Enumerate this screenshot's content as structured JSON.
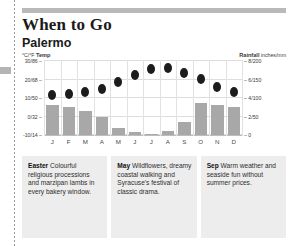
{
  "panel": {
    "title": "When to Go",
    "subtitle": "Palermo"
  },
  "axes": {
    "left_caption_unit": "°C/°F",
    "left_caption_label": "Temp",
    "right_caption_label": "Rainfall",
    "right_caption_unit": "inches/mm",
    "left_ticks": [
      "30/86 –",
      "20/68 –",
      "10/50 –",
      "0/32 –",
      "-10/14 –"
    ],
    "right_ticks": [
      "– 8/200",
      "– 6/150",
      "– 4/100",
      "– 2/50",
      "– 0"
    ]
  },
  "chart_data": {
    "type": "bar",
    "xlabel": "",
    "ylabel": "Temp °C/°F",
    "y2label": "Rainfall inches/mm",
    "grid": true,
    "legend": "none",
    "categories": [
      "J",
      "F",
      "M",
      "A",
      "M",
      "J",
      "J",
      "A",
      "S",
      "O",
      "N",
      "D"
    ],
    "ylim": [
      -10,
      30
    ],
    "y2lim": [
      0,
      200
    ],
    "series": [
      {
        "name": "Rainfall",
        "type": "bar",
        "unit": "mm",
        "axis": "y2",
        "values": [
          80,
          76,
          64,
          50,
          20,
          8,
          3,
          12,
          36,
          86,
          82,
          76
        ]
      },
      {
        "name": "Temp",
        "type": "scatter",
        "unit": "°C",
        "axis": "y",
        "values": [
          11,
          11.5,
          12.5,
          14.5,
          18,
          22,
          25,
          25.5,
          23,
          19.5,
          15.5,
          12.5
        ]
      }
    ]
  },
  "cards": [
    {
      "term": "Easter",
      "text": " Colourful religious processions and marzipan lambs in every bakery window."
    },
    {
      "term": "May",
      "text": " Wildflowers, dreamy coastal walking and Syracuse's festival of classic drama."
    },
    {
      "term": "Sep",
      "text": " Warm weather and seaside fun without summer prices."
    }
  ]
}
